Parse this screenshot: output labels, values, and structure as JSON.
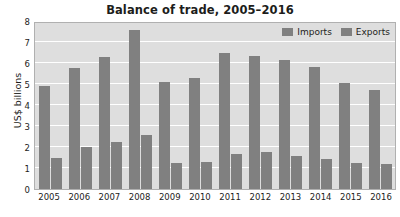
{
  "chart_data": {
    "type": "bar",
    "title": "Balance of trade, 2005–2016",
    "xlabel": "",
    "ylabel": "US$ billions",
    "categories": [
      "2005",
      "2006",
      "2007",
      "2008",
      "2009",
      "2010",
      "2011",
      "2012",
      "2013",
      "2014",
      "2015",
      "2016"
    ],
    "series": [
      {
        "name": "Imports",
        "values": [
          4.9,
          5.75,
          6.3,
          7.55,
          5.1,
          5.3,
          6.5,
          6.35,
          6.15,
          5.8,
          5.05,
          4.7
        ],
        "color": "#808080"
      },
      {
        "name": "Exports",
        "values": [
          1.5,
          2.0,
          2.25,
          2.55,
          1.25,
          1.3,
          1.65,
          1.75,
          1.55,
          1.45,
          1.25,
          1.2
        ],
        "color": "#808080"
      }
    ],
    "ylim": [
      0,
      8
    ],
    "yticks": [
      0,
      1,
      2,
      3,
      4,
      5,
      6,
      7,
      8
    ],
    "ytick_labels": [
      "0",
      "1",
      "2",
      "3",
      "4",
      "5",
      "6",
      "7",
      "8"
    ],
    "grid": true,
    "legend_position": "top-right",
    "plot_background": "#dedede",
    "gridline_color": "#ffffff"
  }
}
